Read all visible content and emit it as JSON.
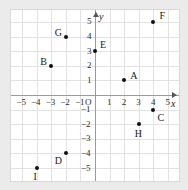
{
  "chart_data": {
    "type": "scatter",
    "title": "",
    "xlabel": "x",
    "ylabel": "y",
    "xlim": [
      -5.8,
      5.8
    ],
    "ylim": [
      -5.8,
      5.8
    ],
    "grid": true,
    "legend": "none",
    "origin_label": "O",
    "x_ticks": [
      "-5",
      "-4",
      "-3",
      "-2",
      "-1",
      "1",
      "2",
      "3",
      "4",
      "5"
    ],
    "y_ticks": [
      "5",
      "4",
      "3",
      "2",
      "1",
      "-1",
      "-2",
      "-3",
      "-4",
      "-5"
    ],
    "points": [
      {
        "label": "A",
        "x": 2,
        "y": 1,
        "label_dx": 6,
        "label_dy": -9
      },
      {
        "label": "B",
        "x": -3,
        "y": 2,
        "label_dx": -11,
        "label_dy": -9
      },
      {
        "label": "C",
        "x": 4,
        "y": -1,
        "label_dx": 4,
        "label_dy": 3
      },
      {
        "label": "D",
        "x": -2,
        "y": -4,
        "label_dx": -11,
        "label_dy": 3
      },
      {
        "label": "E",
        "x": 0,
        "y": 3,
        "label_dx": 5,
        "label_dy": -11
      },
      {
        "label": "F",
        "x": 4,
        "y": 5,
        "label_dx": 6,
        "label_dy": -11
      },
      {
        "label": "G",
        "x": -2,
        "y": 4,
        "label_dx": -11,
        "label_dy": -9
      },
      {
        "label": "H",
        "x": 3,
        "y": -2,
        "label_dx": -4,
        "label_dy": 5
      },
      {
        "label": "I",
        "x": -4,
        "y": -5,
        "label_dx": -3,
        "label_dy": 4
      }
    ]
  }
}
